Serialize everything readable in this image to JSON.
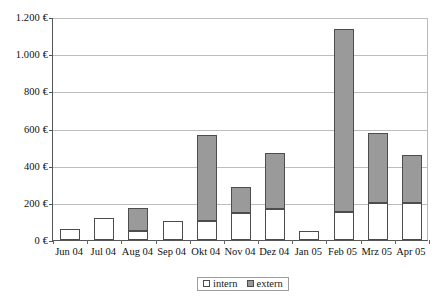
{
  "chart_data": {
    "type": "bar",
    "stacked": true,
    "title": "",
    "subtitle": "",
    "xlabel": "",
    "ylabel": "",
    "categories": [
      "Jun 04",
      "Jul 04",
      "Aug 04",
      "Sep 04",
      "Okt 04",
      "Nov 04",
      "Dez 04",
      "Jan 05",
      "Feb 05",
      "Mrz 05",
      "Apr 05"
    ],
    "series": [
      {
        "name": "intern",
        "color": "#ffffff",
        "values": [
          60,
          120,
          50,
          100,
          105,
          145,
          165,
          50,
          150,
          200,
          200
        ]
      },
      {
        "name": "extern",
        "color": "#9a9a9a",
        "values": [
          0,
          0,
          125,
          0,
          460,
          140,
          305,
          0,
          985,
          375,
          260
        ]
      }
    ],
    "totals": [
      60,
      120,
      175,
      100,
      565,
      285,
      470,
      50,
      1135,
      575,
      460
    ],
    "ylim": [
      0,
      1200
    ],
    "ytick_values": [
      0,
      200,
      400,
      600,
      800,
      1000,
      1200
    ],
    "ytick_labels": [
      "0 €",
      "200 €",
      "400 €",
      "600 €",
      "800 €",
      "1.000 €",
      "1.200 €"
    ],
    "grid": true,
    "legend_position": "bottom-right",
    "currency": "€"
  },
  "legend": {
    "items": [
      {
        "label": "intern",
        "swatch": "swatch-intern"
      },
      {
        "label": "extern",
        "swatch": "swatch-extern"
      }
    ]
  }
}
